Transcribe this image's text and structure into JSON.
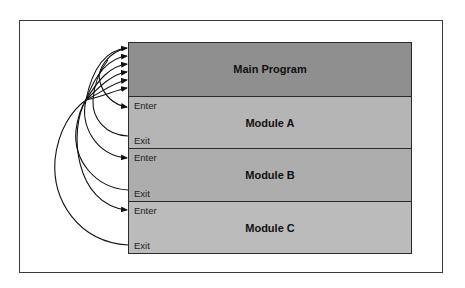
{
  "diagram": {
    "main": {
      "label": "Main Program"
    },
    "modules": [
      {
        "label": "Module A",
        "enter": "Enter",
        "exit": "Exit"
      },
      {
        "label": "Module B",
        "enter": "Enter",
        "exit": "Exit"
      },
      {
        "label": "Module C",
        "enter": "Enter",
        "exit": "Exit"
      }
    ],
    "colors": {
      "main_fill": "#8f8f8f",
      "module_a_fill": "#b5b5b5",
      "module_b_fill": "#adadad",
      "module_c_fill": "#bbbbbb",
      "line": "#111111"
    },
    "connections": [
      {
        "from": "Main Program",
        "to": "Module A",
        "port": "Enter"
      },
      {
        "from": "Module A",
        "to": "Main Program",
        "port": "Exit"
      },
      {
        "from": "Main Program",
        "to": "Module B",
        "port": "Enter"
      },
      {
        "from": "Module B",
        "to": "Main Program",
        "port": "Exit"
      },
      {
        "from": "Main Program",
        "to": "Module C",
        "port": "Enter"
      },
      {
        "from": "Module C",
        "to": "Main Program",
        "port": "Exit"
      }
    ]
  }
}
